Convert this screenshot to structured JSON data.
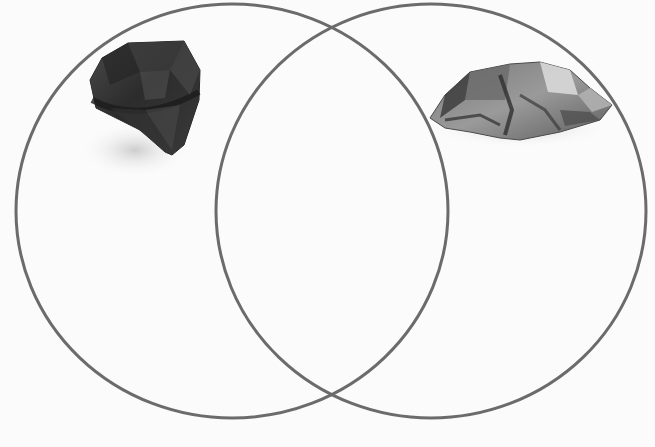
{
  "diagram": {
    "type": "venn",
    "set_count": 2,
    "background": "#fbfbfb",
    "stroke_color": "#6b6b6b",
    "stroke_width": 3,
    "sets": [
      {
        "id": "left",
        "label": "",
        "cx": 232,
        "cy": 211,
        "rx": 216,
        "ry": 207,
        "image": {
          "icon": "cut-gemstone-icon",
          "description": "dark faceted cut gemstone"
        }
      },
      {
        "id": "right",
        "label": "",
        "cx": 431,
        "cy": 211,
        "rx": 215,
        "ry": 207,
        "image": {
          "icon": "rough-crystal-icon",
          "description": "rough metallic mineral crystal"
        }
      }
    ],
    "overlap_label": ""
  }
}
